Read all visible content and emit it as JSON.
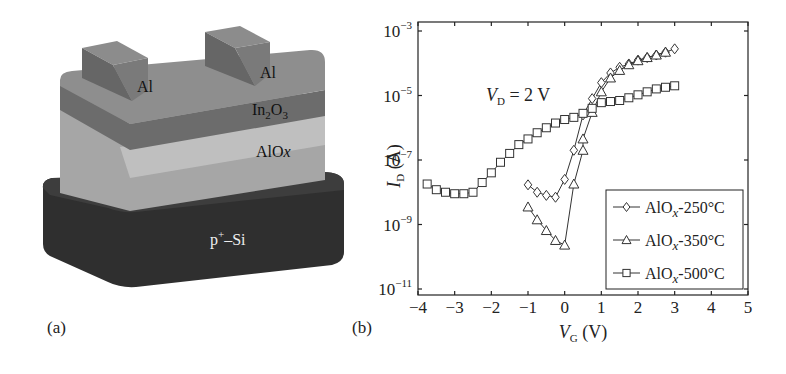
{
  "panel_a": {
    "label": "(a)",
    "layers": {
      "electrode_left": "Al",
      "electrode_right": "Al",
      "channel_main": "In",
      "channel_sub": "2",
      "channel_tail": "O",
      "channel_sub2": "3",
      "dielectric_main": "AlO",
      "dielectric_italic": "x",
      "substrate_main": "p",
      "substrate_sup": "+",
      "substrate_tail": "–Si"
    },
    "colors": {
      "electrode_front": "#6b6b6b",
      "electrode_top": "#8a8a8a",
      "in2o3_top": "#8d8d8d",
      "in2o3_side": "#6e6e6e",
      "alox": "#a9a9a9",
      "alox_highlight": "#c6c6c6",
      "si_top": "#3c3c3c",
      "si_side": "#2e2e2e"
    }
  },
  "panel_b": {
    "label": "(b)",
    "annotation_main": "V",
    "annotation_sub": "D",
    "annotation_tail": " = 2 V",
    "y_label_main": "I",
    "y_label_sub": "D",
    "y_label_tail": " (A)",
    "x_label_main": "V",
    "x_label_sub": "G",
    "x_label_tail": " (V)",
    "y_ticks": [
      {
        "base": "10",
        "exp": "−3",
        "value": -3
      },
      {
        "base": "10",
        "exp": "−5",
        "value": -5
      },
      {
        "base": "10",
        "exp": "−7",
        "value": -7
      },
      {
        "base": "10",
        "exp": "−9",
        "value": -9
      },
      {
        "base": "10",
        "exp": "−11",
        "value": -11
      }
    ],
    "x_ticks": [
      "−4",
      "−3",
      "−2",
      "−1",
      "0",
      "1",
      "2",
      "3",
      "4",
      "5"
    ],
    "legend": [
      {
        "main": "AlO",
        "italic": "x",
        "tail": "-250°C",
        "marker": "diamond"
      },
      {
        "main": "AlO",
        "italic": "x",
        "tail": "-350°C",
        "marker": "triangle"
      },
      {
        "main": "AlO",
        "italic": "x",
        "tail": "-500°C",
        "marker": "square"
      }
    ]
  },
  "chart_data": {
    "type": "line",
    "title": "",
    "annotation": "V_D = 2 V",
    "xlabel": "V_G (V)",
    "ylabel": "I_D (A)",
    "xlim": [
      -4,
      5
    ],
    "ylim": [
      1e-11,
      0.001
    ],
    "yscale": "log",
    "x_ticks": [
      -4,
      -3,
      -2,
      -1,
      0,
      1,
      2,
      3,
      4,
      5
    ],
    "y_ticks": [
      0.001,
      1e-05,
      1e-07,
      1e-09,
      1e-11
    ],
    "grid": false,
    "legend_position": "lower right",
    "series": [
      {
        "name": "AlOx-250°C",
        "marker": "diamond",
        "x": [
          -1,
          -0.75,
          -0.5,
          -0.25,
          0,
          0.25,
          0.5,
          0.75,
          1,
          1.25,
          1.5,
          1.75,
          2,
          2.25,
          2.5,
          2.75,
          3
        ],
        "y": [
          1.7e-08,
          1e-08,
          8e-09,
          7e-09,
          2.5e-08,
          2e-07,
          2.5e-06,
          8e-06,
          2.5e-05,
          5e-05,
          7.5e-05,
          9.5e-05,
          0.000125,
          0.00015,
          0.00018,
          0.00022,
          0.00028
        ]
      },
      {
        "name": "AlOx-350°C",
        "marker": "triangle",
        "x": [
          -1,
          -0.75,
          -0.5,
          -0.25,
          0,
          0.25,
          0.5,
          0.5,
          0.75,
          1,
          1.25,
          1.5,
          1.75,
          2,
          2.25,
          2.5,
          2.75
        ],
        "y": [
          3.5e-09,
          1.4e-09,
          6.5e-10,
          3.2e-10,
          2.3e-10,
          1.8e-08,
          2e-07,
          4.5e-07,
          3e-06,
          1.3e-05,
          3.5e-05,
          6e-05,
          9e-05,
          0.00012,
          0.00015,
          0.00018,
          0.00022
        ]
      },
      {
        "name": "AlOx-500°C",
        "marker": "square",
        "x": [
          -3.75,
          -3.5,
          -3.25,
          -3,
          -2.75,
          -2.5,
          -2.25,
          -2,
          -1.75,
          -1.5,
          -1.25,
          -1,
          -0.75,
          -0.5,
          -0.25,
          0,
          0.25,
          0.5,
          0.75,
          1,
          1.25,
          1.5,
          1.75,
          2,
          2.25,
          2.5,
          2.75,
          3
        ],
        "y": [
          1.8e-08,
          1.2e-08,
          1e-08,
          9e-09,
          9e-09,
          1e-08,
          2e-08,
          4e-08,
          8.5e-08,
          1.6e-07,
          3e-07,
          4.5e-07,
          7e-07,
          1e-06,
          1.4e-06,
          1.8e-06,
          2.1e-06,
          2.8e-06,
          4e-06,
          6e-06,
          6.5e-06,
          7e-06,
          8.5e-06,
          1.05e-05,
          1.3e-05,
          1.6e-05,
          1.8e-05,
          2e-05
        ]
      }
    ]
  }
}
